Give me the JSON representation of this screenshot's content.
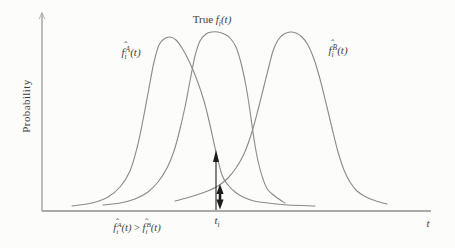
{
  "figure": {
    "background": "#fcfcfa",
    "ink_color": "#3c3c3c",
    "curve_color": "#8a8a8a",
    "axis_color": "#8f8f8f",
    "arrow_color": "#1c1c1c"
  },
  "labels": {
    "y_axis": "Probability",
    "x_axis": "t",
    "true_curve": {
      "prefix": "True ",
      "f": "f",
      "sub": "i",
      "args": "(t)"
    },
    "curve_a": {
      "f": "f",
      "hat": "ˆ",
      "sub": "i",
      "sup": "A",
      "args": "(t)"
    },
    "curve_b": {
      "f": "f",
      "hat": "ˆ",
      "sub": "i",
      "sup": "B",
      "args": "(t)"
    },
    "t_i": {
      "t": "t",
      "sub": "i"
    },
    "inequality": {
      "lf": "f",
      "lhat": "ˆ",
      "lsub": "i",
      "lsup": "A",
      "largs": "(t)",
      "op": " > ",
      "rf": "f",
      "rhat": "ˆ",
      "rsub": "i",
      "rsup": "B",
      "rargs": "(t)"
    }
  },
  "chart_data": {
    "type": "line",
    "title": "",
    "xlabel": "t",
    "ylabel": "Probability",
    "grid": false,
    "legend": "none",
    "axis_px": {
      "x_start": 42,
      "x_end": 431,
      "y_base": 211,
      "y_top": 13
    },
    "series": [
      {
        "name": "estimate-A",
        "label": "f̂_i^A(t)",
        "peak_x": 167,
        "peak_y": 37,
        "points": [
          [
            72,
            206
          ],
          [
            92,
            203
          ],
          [
            108,
            197
          ],
          [
            120,
            187
          ],
          [
            130,
            171
          ],
          [
            137,
            148
          ],
          [
            143,
            120
          ],
          [
            149,
            88
          ],
          [
            154,
            62
          ],
          [
            159,
            45
          ],
          [
            164,
            39
          ],
          [
            170,
            37
          ],
          [
            176,
            40
          ],
          [
            182,
            48
          ],
          [
            189,
            61
          ],
          [
            197,
            80
          ],
          [
            204,
            101
          ],
          [
            210,
            125
          ],
          [
            216,
            152
          ],
          [
            222,
            175
          ],
          [
            228,
            185
          ],
          [
            235,
            192
          ],
          [
            243,
            197
          ],
          [
            254,
            201
          ],
          [
            268,
            203
          ],
          [
            288,
            205
          ],
          [
            315,
            206
          ]
        ]
      },
      {
        "name": "true-density",
        "label": "True f_i(t)",
        "peak_x": 215,
        "peak_y": 32,
        "points": [
          [
            103,
            205
          ],
          [
            120,
            203
          ],
          [
            135,
            199
          ],
          [
            148,
            192
          ],
          [
            158,
            182
          ],
          [
            167,
            168
          ],
          [
            174,
            151
          ],
          [
            180,
            129
          ],
          [
            185,
            107
          ],
          [
            190,
            81
          ],
          [
            195,
            56
          ],
          [
            200,
            41
          ],
          [
            206,
            34
          ],
          [
            212,
            32
          ],
          [
            218,
            32
          ],
          [
            224,
            34
          ],
          [
            230,
            38
          ],
          [
            236,
            47
          ],
          [
            241,
            63
          ],
          [
            246,
            86
          ],
          [
            250,
            111
          ],
          [
            254,
            139
          ],
          [
            258,
            161
          ],
          [
            263,
            179
          ],
          [
            268,
            190
          ],
          [
            276,
            197
          ],
          [
            285,
            203
          ]
        ]
      },
      {
        "name": "estimate-B",
        "label": "f̂_i^B(t)",
        "peak_x": 290,
        "peak_y": 32,
        "points": [
          [
            175,
            201
          ],
          [
            190,
            197
          ],
          [
            205,
            192
          ],
          [
            218,
            186
          ],
          [
            228,
            178
          ],
          [
            236,
            168
          ],
          [
            243,
            156
          ],
          [
            249,
            141
          ],
          [
            254,
            125
          ],
          [
            259,
            106
          ],
          [
            264,
            86
          ],
          [
            269,
            66
          ],
          [
            273,
            51
          ],
          [
            278,
            40
          ],
          [
            284,
            34
          ],
          [
            290,
            32
          ],
          [
            296,
            33
          ],
          [
            302,
            37
          ],
          [
            308,
            45
          ],
          [
            314,
            59
          ],
          [
            320,
            79
          ],
          [
            326,
            103
          ],
          [
            332,
            128
          ],
          [
            338,
            152
          ],
          [
            344,
            170
          ],
          [
            350,
            182
          ],
          [
            357,
            191
          ],
          [
            366,
            197
          ],
          [
            376,
            201
          ],
          [
            387,
            204
          ]
        ]
      }
    ],
    "markers": {
      "t_i_x": 216,
      "thin_arrow": {
        "x": 216,
        "y_bottom": 210,
        "y_tip": 150,
        "meaning": "density of estimate A at t_i"
      },
      "bold_arrow": {
        "x": 220,
        "y_top_tip": 184,
        "y_bottom_tip": 209.5,
        "meaning": "density of estimate B at t_i"
      }
    }
  }
}
